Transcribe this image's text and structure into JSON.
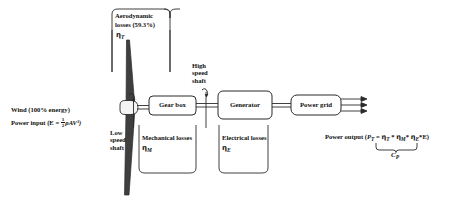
{
  "diagram": {
    "colors": {
      "stroke": "#2b2b2b",
      "blade": "#3a3a3a",
      "background": "#ffffff"
    },
    "top_bracket": {
      "line1": "Aerodynamic",
      "line2": "losses (59.3%)",
      "efficiency_symbol": "η",
      "efficiency_subscript": "T"
    },
    "wind_input": {
      "line1": "Wind (100% energy)",
      "line2_prefix": "Power input (E = ",
      "fraction_numerator": "1",
      "fraction_denominator": "2",
      "formula_tail": "ρAV³)",
      "line2_full": "Power input (E = 1/2 ρAV³)"
    },
    "low_speed_shaft": {
      "line1": "Low",
      "line2": "speed",
      "line3": "shaft"
    },
    "high_speed_shaft": {
      "line1": "High",
      "line2": "speed",
      "line3": "shaft"
    },
    "gear_box": {
      "label": "Gear box"
    },
    "generator": {
      "label": "Generator"
    },
    "power_grid": {
      "label": "Power grid"
    },
    "mechanical_losses": {
      "label": "Mechanical losses",
      "efficiency_symbol": "η",
      "efficiency_subscript": "M"
    },
    "electrical_losses": {
      "label": "Electrical losses",
      "efficiency_symbol": "η",
      "efficiency_subscript": "E"
    },
    "power_output": {
      "prefix": "Power output (",
      "p_symbol": "P",
      "p_subscript": "T",
      "equals": " = ",
      "eta1": "η",
      "eta1_sub": "T",
      "op1": " * ",
      "eta2": "η",
      "eta2_sub": "M",
      "op2": "* ",
      "eta3": "η",
      "eta3_sub": "E",
      "op3": "*E)",
      "full": "Power output (P_T = η_T * η_M * η_E *E)",
      "brace_label_symbol": "C",
      "brace_label_subscript": "P"
    },
    "rotation_markers": [
      {
        "name": "low-speed-rotation",
        "symbol": "↷"
      },
      {
        "name": "high-speed-rotation",
        "symbol": "↷"
      }
    ],
    "grid_arrow_count": 3
  }
}
